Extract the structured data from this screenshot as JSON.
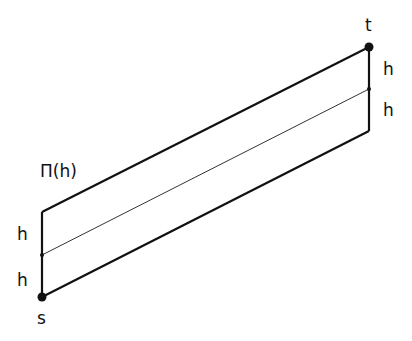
{
  "diagram": {
    "title_label": "Π(h)",
    "source_label": "s",
    "target_label": "t",
    "left_segments": [
      "h",
      "h"
    ],
    "right_segments": [
      "h",
      "h"
    ],
    "points": {
      "s": [
        42,
        297
      ],
      "left_mid": [
        42,
        255
      ],
      "left_top": [
        42,
        212
      ],
      "right_bottom": [
        369,
        131
      ],
      "right_mid": [
        369,
        89
      ],
      "t": [
        369,
        47
      ]
    },
    "colors": {
      "stroke": "#111111",
      "background": "#ffffff"
    }
  }
}
